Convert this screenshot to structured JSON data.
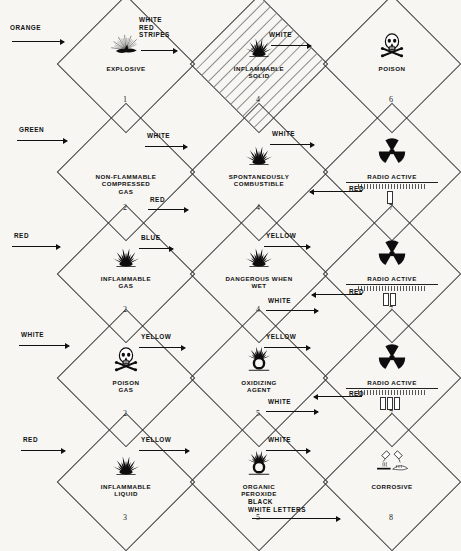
{
  "page": {
    "background": "#f7f6f3",
    "ink": "#111111"
  },
  "placards": [
    {
      "id": "explosive",
      "label": "EXPLOSIVE",
      "class_number": "1",
      "icon": "explosion-icon",
      "annotations": [
        {
          "name": "colour-note-orange",
          "text": "ORANGE",
          "arrow": "right"
        }
      ]
    },
    {
      "id": "inflammable-solid",
      "label": "INFLAMMABLE\nSOLID",
      "class_number": "4",
      "icon": "flame-icon",
      "stripes": true,
      "annotations": [
        {
          "name": "colour-note-white-red-stripes",
          "text": "WHITE\nRED\nSTRIPES",
          "arrow": "right"
        }
      ]
    },
    {
      "id": "poison",
      "label": "POISON",
      "class_number": "6",
      "icon": "skull-crossbones-icon",
      "annotations": [
        {
          "name": "colour-note-white",
          "text": "WHITE",
          "arrow": "right"
        }
      ]
    },
    {
      "id": "non-flammable-compressed-gas",
      "label": "NON-FLAMMABLE\nCOMPRESSED\nGAS",
      "class_number": "2",
      "icon": "gas-cylinder-icon",
      "annotations": [
        {
          "name": "colour-note-green",
          "text": "GREEN",
          "arrow": "right"
        }
      ]
    },
    {
      "id": "spontaneously-combustible",
      "label": "SPONTANEOUSLY\nCOMBUSTIBLE",
      "class_number": "4",
      "icon": "flame-icon",
      "annotations": [
        {
          "name": "colour-note-white",
          "text": "WHITE",
          "arrow": "right"
        },
        {
          "name": "colour-note-red",
          "text": "RED",
          "arrow": "right"
        }
      ]
    },
    {
      "id": "radioactive-i",
      "label": "RADIO ACTIVE",
      "class_number": "7",
      "icon": "trefoil-icon",
      "bars": 1,
      "annotations": [
        {
          "name": "colour-note-white",
          "text": "WHITE",
          "arrow": "right"
        },
        {
          "name": "colour-note-red",
          "text": "RED",
          "arrow": "left"
        }
      ]
    },
    {
      "id": "inflammable-gas",
      "label": "INFLAMMABLE\nGAS",
      "class_number": "2",
      "icon": "flame-icon",
      "annotations": [
        {
          "name": "colour-note-red",
          "text": "RED",
          "arrow": "right"
        }
      ]
    },
    {
      "id": "dangerous-when-wet",
      "label": "DANGEROUS WHEN\nWET",
      "class_number": "4",
      "icon": "flame-icon",
      "annotations": [
        {
          "name": "colour-note-blue",
          "text": "BLUE",
          "arrow": "right"
        }
      ]
    },
    {
      "id": "radioactive-ii",
      "label": "RADIO ACTIVE",
      "class_number": "7",
      "icon": "trefoil-icon",
      "bars": 2,
      "annotations": [
        {
          "name": "colour-note-yellow",
          "text": "YELLOW",
          "arrow": "right"
        },
        {
          "name": "colour-note-red",
          "text": "RED",
          "arrow": "left"
        },
        {
          "name": "colour-note-white",
          "text": "WHITE",
          "arrow": "right"
        }
      ]
    },
    {
      "id": "poison-gas",
      "label": "POISON\nGAS",
      "class_number": "2",
      "icon": "skull-crossbones-icon",
      "annotations": [
        {
          "name": "colour-note-white",
          "text": "WHITE",
          "arrow": "right"
        }
      ]
    },
    {
      "id": "oxidizing-agent",
      "label": "OXIDIZING\nAGENT",
      "class_number": "5",
      "icon": "oxidizer-icon",
      "annotations": [
        {
          "name": "colour-note-yellow",
          "text": "YELLOW",
          "arrow": "right"
        }
      ]
    },
    {
      "id": "radioactive-iii",
      "label": "RADIO ACTIVE",
      "class_number": "7",
      "icon": "trefoil-icon",
      "bars": 3,
      "annotations": [
        {
          "name": "colour-note-yellow",
          "text": "YELLOW",
          "arrow": "right"
        },
        {
          "name": "colour-note-red",
          "text": "RED",
          "arrow": "left"
        },
        {
          "name": "colour-note-white",
          "text": "WHITE",
          "arrow": "right"
        }
      ]
    },
    {
      "id": "inflammable-liquid",
      "label": "INFLAMMABLE\nLIQUID",
      "class_number": "3",
      "icon": "flame-icon",
      "annotations": [
        {
          "name": "colour-note-red",
          "text": "RED",
          "arrow": "right"
        }
      ]
    },
    {
      "id": "organic-peroxide",
      "label": "ORGANIC\nPEROXIDE",
      "class_number": "5",
      "icon": "oxidizer-icon",
      "annotations": [
        {
          "name": "colour-note-yellow",
          "text": "YELLOW",
          "arrow": "right"
        }
      ]
    },
    {
      "id": "corrosive",
      "label": "CORROSIVE",
      "class_number": "8",
      "icon": "corrosive-icon",
      "annotations": [
        {
          "name": "colour-note-white",
          "text": "WHITE",
          "arrow": "right"
        },
        {
          "name": "colour-note-black-white-letters",
          "text": "BLACK\nWHITE LETTERS",
          "arrow": "right"
        }
      ]
    }
  ]
}
